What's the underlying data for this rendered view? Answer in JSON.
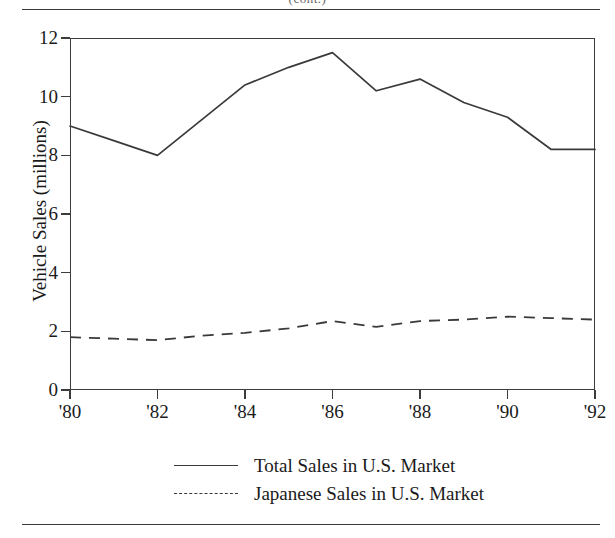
{
  "page": {
    "running_head": "(cont.)"
  },
  "chart_data": {
    "type": "line",
    "title": "",
    "xlabel": "",
    "ylabel": "Vehicle Sales (millions)",
    "grid": false,
    "legend_position": "bottom-center",
    "xlim": [
      1980,
      1992
    ],
    "ylim": [
      0,
      12
    ],
    "ytick_labels": [
      "0",
      "2",
      "4",
      "6",
      "8",
      "10",
      "12"
    ],
    "ytick_values": [
      0,
      2,
      4,
      6,
      8,
      10,
      12
    ],
    "xtick_labels": [
      "'80",
      "'82",
      "'84",
      "'86",
      "'88",
      "'90",
      "'92"
    ],
    "xtick_values": [
      1980,
      1982,
      1984,
      1986,
      1988,
      1990,
      1992
    ],
    "x": [
      1980,
      1981,
      1982,
      1983,
      1984,
      1985,
      1986,
      1987,
      1988,
      1989,
      1990,
      1991,
      1992
    ],
    "series": [
      {
        "name": "Total Sales in U.S. Market",
        "style": "solid",
        "color": "#3a3a3a",
        "values": [
          9.0,
          8.5,
          8.0,
          9.2,
          10.4,
          11.0,
          11.5,
          10.2,
          10.6,
          9.8,
          9.3,
          8.2,
          8.2
        ]
      },
      {
        "name": "Japanese Sales in U.S. Market",
        "style": "dashed",
        "color": "#3a3a3a",
        "values": [
          1.8,
          1.75,
          1.7,
          1.85,
          1.95,
          2.1,
          2.35,
          2.15,
          2.35,
          2.4,
          2.5,
          2.45,
          2.4
        ]
      }
    ]
  }
}
